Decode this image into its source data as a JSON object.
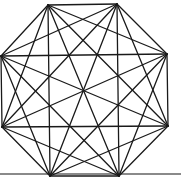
{
  "diagram": {
    "background": "#ffffff",
    "stroke_color": "#1a1a1a",
    "stroke_width": 1.3,
    "vertices": [
      {
        "id": "v0",
        "x": 48,
        "y": 5
      },
      {
        "id": "v1",
        "x": 117,
        "y": 4
      },
      {
        "id": "v2",
        "x": 167,
        "y": 54
      },
      {
        "id": "v3",
        "x": 168,
        "y": 126
      },
      {
        "id": "v4",
        "x": 119,
        "y": 176
      },
      {
        "id": "v5",
        "x": 50,
        "y": 176
      },
      {
        "id": "v6",
        "x": 2,
        "y": 127
      },
      {
        "id": "v7",
        "x": 1,
        "y": 56
      }
    ],
    "baseline": {
      "x1": 0,
      "y1": 174,
      "x2": 181,
      "y2": 174,
      "color": "#8a8a8a",
      "width": 2
    }
  }
}
